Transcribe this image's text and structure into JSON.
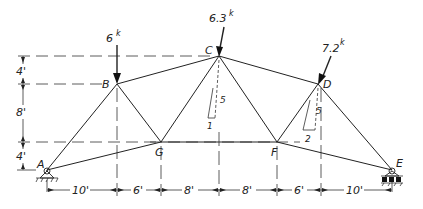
{
  "diagram": {
    "type": "truss",
    "joints": {
      "A": "A",
      "B": "B",
      "C": "C",
      "D": "D",
      "E": "E",
      "F": "F",
      "G": "G"
    },
    "loads": [
      {
        "joint": "B",
        "value": "6",
        "unit": "k",
        "direction": "vertical-down"
      },
      {
        "joint": "C",
        "value": "6.3",
        "unit": "k",
        "direction": "inclined",
        "slope_rise": "5",
        "slope_run": "1"
      },
      {
        "joint": "D",
        "value": "7.2",
        "unit": "k",
        "direction": "inclined",
        "slope_rise": "5",
        "slope_run": "2"
      }
    ],
    "slopes": {
      "C": {
        "rise": "5",
        "run": "1"
      },
      "D": {
        "rise": "5",
        "run": "2"
      }
    },
    "vertical_dims": [
      "4'",
      "8'",
      "4'"
    ],
    "horizontal_dims": [
      "10'",
      "6'",
      "8'",
      "8'",
      "6'",
      "10'"
    ],
    "supports": {
      "A": "pin",
      "E": "roller"
    },
    "colors": {
      "line": "#222222",
      "background": "#ffffff"
    }
  }
}
